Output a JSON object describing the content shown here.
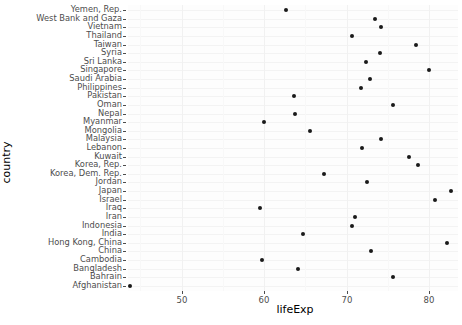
{
  "axes": {
    "y_title": "country",
    "x_title": "lifeExp",
    "x_ticks": [
      50,
      60,
      70,
      80
    ],
    "x_tick_labels": [
      "50",
      "60",
      "70",
      "80"
    ]
  },
  "chart_data": {
    "type": "scatter",
    "title": "",
    "xlabel": "lifeExp",
    "ylabel": "country",
    "xlim": [
      43.5,
      83.5
    ],
    "grid": true,
    "legend": null,
    "orientation": "horizontal-dotplot",
    "categories": [
      "Yemen, Rep.",
      "West Bank and Gaza",
      "Vietnam",
      "Thailand",
      "Taiwan",
      "Syria",
      "Sri Lanka",
      "Singapore",
      "Saudi Arabia",
      "Philippines",
      "Pakistan",
      "Oman",
      "Nepal",
      "Myanmar",
      "Mongolia",
      "Malaysia",
      "Lebanon",
      "Kuwait",
      "Korea, Rep.",
      "Korea, Dem. Rep.",
      "Jordan",
      "Japan",
      "Israel",
      "Iraq",
      "Iran",
      "Indonesia",
      "India",
      "Hong Kong, China",
      "China",
      "Cambodia",
      "Bangladesh",
      "Bahrain",
      "Afghanistan"
    ],
    "values": [
      62.7,
      73.4,
      74.2,
      70.6,
      78.4,
      74.1,
      72.4,
      80.0,
      72.8,
      71.7,
      63.6,
      75.6,
      63.8,
      60.0,
      65.5,
      74.2,
      71.9,
      77.6,
      78.6,
      67.3,
      72.5,
      82.6,
      80.7,
      59.5,
      71.0,
      70.6,
      64.7,
      82.2,
      72.9,
      59.7,
      64.1,
      75.6,
      43.8
    ],
    "series": [
      {
        "name": "lifeExp",
        "points": [
          {
            "country": "Yemen, Rep.",
            "lifeExp": 62.7
          },
          {
            "country": "West Bank and Gaza",
            "lifeExp": 73.4
          },
          {
            "country": "Vietnam",
            "lifeExp": 74.2
          },
          {
            "country": "Thailand",
            "lifeExp": 70.6
          },
          {
            "country": "Taiwan",
            "lifeExp": 78.4
          },
          {
            "country": "Syria",
            "lifeExp": 74.1
          },
          {
            "country": "Sri Lanka",
            "lifeExp": 72.4
          },
          {
            "country": "Singapore",
            "lifeExp": 80.0
          },
          {
            "country": "Saudi Arabia",
            "lifeExp": 72.8
          },
          {
            "country": "Philippines",
            "lifeExp": 71.7
          },
          {
            "country": "Pakistan",
            "lifeExp": 63.6
          },
          {
            "country": "Oman",
            "lifeExp": 75.6
          },
          {
            "country": "Nepal",
            "lifeExp": 63.8
          },
          {
            "country": "Myanmar",
            "lifeExp": 60.0
          },
          {
            "country": "Mongolia",
            "lifeExp": 65.5
          },
          {
            "country": "Malaysia",
            "lifeExp": 74.2
          },
          {
            "country": "Lebanon",
            "lifeExp": 71.9
          },
          {
            "country": "Kuwait",
            "lifeExp": 77.6
          },
          {
            "country": "Korea, Rep.",
            "lifeExp": 78.6
          },
          {
            "country": "Korea, Dem. Rep.",
            "lifeExp": 67.3
          },
          {
            "country": "Jordan",
            "lifeExp": 72.5
          },
          {
            "country": "Japan",
            "lifeExp": 82.6
          },
          {
            "country": "Israel",
            "lifeExp": 80.7
          },
          {
            "country": "Iraq",
            "lifeExp": 59.5
          },
          {
            "country": "Iran",
            "lifeExp": 71.0
          },
          {
            "country": "Indonesia",
            "lifeExp": 70.6
          },
          {
            "country": "India",
            "lifeExp": 64.7
          },
          {
            "country": "Hong Kong, China",
            "lifeExp": 82.2
          },
          {
            "country": "China",
            "lifeExp": 72.9
          },
          {
            "country": "Cambodia",
            "lifeExp": 59.7
          },
          {
            "country": "Bangladesh",
            "lifeExp": 64.1
          },
          {
            "country": "Bahrain",
            "lifeExp": 75.6
          },
          {
            "country": "Afghanistan",
            "lifeExp": 43.8
          }
        ]
      }
    ]
  },
  "style": {
    "point_color": "#1a1a1a",
    "panel_background": "#fdfdfd",
    "grid_color": "#f2f2f2",
    "text_color": "#4d4d4d",
    "title_color": "#000000"
  }
}
